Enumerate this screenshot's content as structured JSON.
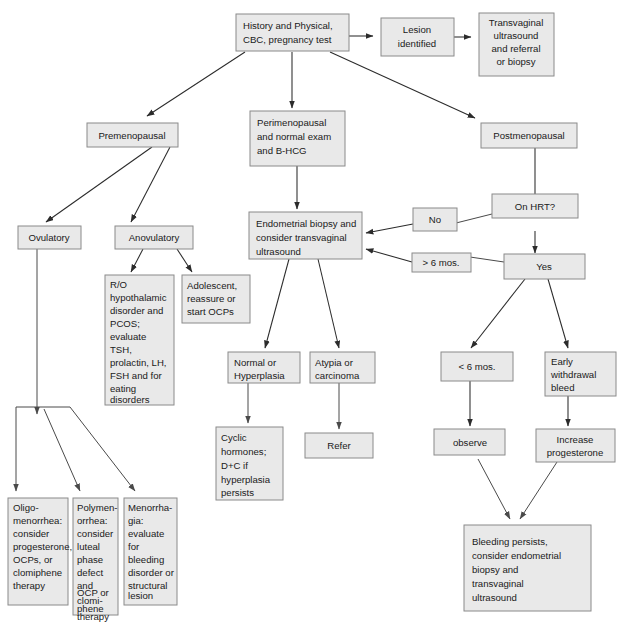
{
  "diagram": {
    "type": "flowchart",
    "colors": {
      "box_fill": "#e9e9e9",
      "box_stroke": "#8a8a8a",
      "edge": "#2b2b2b",
      "text": "#1a1a1a",
      "background": "#ffffff"
    },
    "nodes": [
      {
        "id": "history",
        "lines": [
          "History and Physical,",
          "CBC, pregnancy test"
        ]
      },
      {
        "id": "lesion",
        "lines": [
          "Lesion",
          "identified"
        ]
      },
      {
        "id": "transvaginal",
        "lines": [
          "Transvaginal",
          "ultrasound",
          "and referral",
          "or biopsy"
        ]
      },
      {
        "id": "premenopausal",
        "lines": [
          "Premenopausal"
        ]
      },
      {
        "id": "perimenopausal",
        "lines": [
          "Perimenopausal",
          "and normal exam",
          "and B-HCG"
        ]
      },
      {
        "id": "postmenopausal",
        "lines": [
          "Postmenopausal"
        ]
      },
      {
        "id": "ovulatory",
        "lines": [
          "Ovulatory"
        ]
      },
      {
        "id": "anovulatory",
        "lines": [
          "Anovulatory"
        ]
      },
      {
        "id": "endometrial",
        "lines": [
          "Endometrial biopsy and",
          "consider transvaginal",
          "ultrasound"
        ]
      },
      {
        "id": "onhrt",
        "lines": [
          "On HRT?"
        ]
      },
      {
        "id": "no",
        "lines": [
          "No"
        ]
      },
      {
        "id": "yes",
        "lines": [
          "Yes"
        ]
      },
      {
        "id": "sixmos",
        "lines": [
          "> 6 mos."
        ]
      },
      {
        "id": "ro",
        "lines": [
          "R/O",
          "hypothalamic",
          "disorder and",
          "PCOS;",
          "evaluate",
          "TSH,",
          "prolactin, LH,",
          "FSH and for",
          "eating",
          "disorders"
        ]
      },
      {
        "id": "adolescent",
        "lines": [
          "Adolescent,",
          "reassure or",
          "start OCPs"
        ]
      },
      {
        "id": "normal",
        "lines": [
          "Normal or",
          "Hyperplasia"
        ]
      },
      {
        "id": "atypia",
        "lines": [
          "Atypia or",
          "carcinoma"
        ]
      },
      {
        "id": "lessmos",
        "lines": [
          "< 6 mos."
        ]
      },
      {
        "id": "early",
        "lines": [
          "Early",
          "withdrawal",
          "bleed"
        ]
      },
      {
        "id": "cyclic",
        "lines": [
          "Cyclic",
          "hormones;",
          "D+C if",
          "hyperplasia",
          "persists"
        ]
      },
      {
        "id": "refer",
        "lines": [
          "Refer"
        ]
      },
      {
        "id": "observe",
        "lines": [
          "observe"
        ]
      },
      {
        "id": "increase",
        "lines": [
          "Increase",
          "progesterone"
        ]
      },
      {
        "id": "oligo",
        "lines": [
          "Oligo-",
          "menorrhea:",
          "consider",
          "progesterone,",
          "OCPs, or",
          "clomiphene",
          "therapy"
        ]
      },
      {
        "id": "poly",
        "lines": [
          "Polymen-",
          "orrhea:",
          "consider",
          "luteal",
          "phase",
          "defect",
          "and",
          "OCP or",
          "clomi-",
          "phene",
          "therapy"
        ]
      },
      {
        "id": "menorrhagia",
        "lines": [
          "Menorrha-",
          "gia:",
          "evaluate",
          "for",
          "bleeding",
          "disorder or",
          "structural",
          "lesion"
        ]
      },
      {
        "id": "bleeding",
        "lines": [
          "Bleeding persists,",
          "consider endometrial",
          "biopsy and",
          "transvaginal",
          "ultrasound"
        ]
      }
    ],
    "edges": [
      {
        "from": "history",
        "to": "lesion"
      },
      {
        "from": "lesion",
        "to": "transvaginal"
      },
      {
        "from": "history",
        "to": "premenopausal"
      },
      {
        "from": "history",
        "to": "perimenopausal"
      },
      {
        "from": "history",
        "to": "postmenopausal"
      },
      {
        "from": "premenopausal",
        "to": "ovulatory"
      },
      {
        "from": "premenopausal",
        "to": "anovulatory"
      },
      {
        "from": "perimenopausal",
        "to": "endometrial"
      },
      {
        "from": "postmenopausal",
        "to": "onhrt"
      },
      {
        "from": "onhrt",
        "to": "endometrial",
        "label": "No"
      },
      {
        "from": "onhrt",
        "to": "yes"
      },
      {
        "from": "yes",
        "to": "endometrial",
        "label": "> 6 mos."
      },
      {
        "from": "anovulatory",
        "to": "ro"
      },
      {
        "from": "anovulatory",
        "to": "adolescent"
      },
      {
        "from": "endometrial",
        "to": "normal"
      },
      {
        "from": "endometrial",
        "to": "atypia"
      },
      {
        "from": "normal",
        "to": "cyclic"
      },
      {
        "from": "atypia",
        "to": "refer"
      },
      {
        "from": "yes",
        "to": "lessmos"
      },
      {
        "from": "yes",
        "to": "early"
      },
      {
        "from": "lessmos",
        "to": "observe"
      },
      {
        "from": "early",
        "to": "increase"
      },
      {
        "from": "observe",
        "to": "bleeding"
      },
      {
        "from": "increase",
        "to": "bleeding"
      },
      {
        "from": "ovulatory",
        "to": "oligo"
      },
      {
        "from": "ovulatory",
        "to": "poly"
      },
      {
        "from": "ovulatory",
        "to": "menorrhagia"
      }
    ]
  }
}
